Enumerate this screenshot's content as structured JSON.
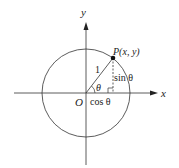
{
  "diagram": {
    "type": "unit-circle",
    "labels": {
      "y_axis": "y",
      "x_axis": "x",
      "origin": "O",
      "point": "P(x, y)",
      "radius": "1",
      "angle": "θ",
      "sin": "sin θ",
      "cos": "cos θ"
    },
    "colors": {
      "line": "#333333",
      "background": "#ffffff"
    }
  }
}
